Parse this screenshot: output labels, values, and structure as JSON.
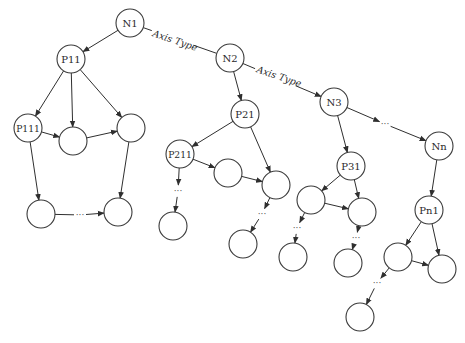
{
  "diagram": {
    "title": "",
    "colors": {
      "stroke": "#3a3a3a",
      "edge": "#2f2f2f",
      "text": "#2a2a2a",
      "background": "#ffffff"
    },
    "node_radius": 14,
    "nodes": [
      {
        "id": "N1",
        "label": "N1",
        "x": 130,
        "y": 23
      },
      {
        "id": "N2",
        "label": "N2",
        "x": 230,
        "y": 58
      },
      {
        "id": "N3",
        "label": "N3",
        "x": 334,
        "y": 102
      },
      {
        "id": "Nn",
        "label": "Nn",
        "x": 439,
        "y": 146
      },
      {
        "id": "P11",
        "label": "P11",
        "x": 71,
        "y": 59
      },
      {
        "id": "P111",
        "label": "P111",
        "x": 28,
        "y": 128
      },
      {
        "id": "a1",
        "label": "",
        "x": 73,
        "y": 141
      },
      {
        "id": "a2",
        "label": "",
        "x": 131,
        "y": 128
      },
      {
        "id": "a3",
        "label": "",
        "x": 41,
        "y": 214
      },
      {
        "id": "a4",
        "label": "",
        "x": 118,
        "y": 212
      },
      {
        "id": "P21",
        "label": "P21",
        "x": 245,
        "y": 114
      },
      {
        "id": "P211",
        "label": "P211",
        "x": 180,
        "y": 154
      },
      {
        "id": "b1",
        "label": "",
        "x": 228,
        "y": 173
      },
      {
        "id": "b2",
        "label": "",
        "x": 276,
        "y": 185
      },
      {
        "id": "b3",
        "label": "",
        "x": 173,
        "y": 226
      },
      {
        "id": "b4",
        "label": "",
        "x": 243,
        "y": 244
      },
      {
        "id": "P31",
        "label": "P31",
        "x": 351,
        "y": 166
      },
      {
        "id": "c1",
        "label": "",
        "x": 311,
        "y": 200
      },
      {
        "id": "c2",
        "label": "",
        "x": 362,
        "y": 212
      },
      {
        "id": "c3",
        "label": "",
        "x": 293,
        "y": 257
      },
      {
        "id": "c4",
        "label": "",
        "x": 348,
        "y": 263
      },
      {
        "id": "Pn1",
        "label": "Pn1",
        "x": 429,
        "y": 210
      },
      {
        "id": "d1",
        "label": "",
        "x": 398,
        "y": 257
      },
      {
        "id": "d2",
        "label": "",
        "x": 442,
        "y": 269
      },
      {
        "id": "d3",
        "label": "",
        "x": 360,
        "y": 317
      }
    ],
    "ellipses": [
      {
        "id": "e_top",
        "text": "···",
        "x": 385,
        "y": 124
      },
      {
        "id": "e_a",
        "text": "···",
        "x": 80,
        "y": 215
      },
      {
        "id": "e_b1",
        "text": "···",
        "x": 178,
        "y": 191
      },
      {
        "id": "e_b2",
        "text": "···",
        "x": 262,
        "y": 214
      },
      {
        "id": "e_c1",
        "text": "···",
        "x": 297,
        "y": 228
      },
      {
        "id": "e_c2",
        "text": "···",
        "x": 356,
        "y": 238
      },
      {
        "id": "e_d",
        "text": "···",
        "x": 377,
        "y": 283
      }
    ],
    "edges": [
      {
        "from": "N1",
        "to": "N2",
        "arrow": false,
        "label": "Axis Type"
      },
      {
        "from": "N2",
        "to": "N3",
        "arrow": true,
        "label": "Axis Type"
      },
      {
        "from": "N3",
        "to": "e_top",
        "arrow": true
      },
      {
        "from": "e_top",
        "to": "Nn",
        "arrow": true
      },
      {
        "from": "N1",
        "to": "P11",
        "arrow": true
      },
      {
        "from": "P11",
        "to": "P111",
        "arrow": true
      },
      {
        "from": "P11",
        "to": "a1",
        "arrow": true
      },
      {
        "from": "P11",
        "to": "a2",
        "arrow": true
      },
      {
        "from": "P111",
        "to": "a1",
        "arrow": true
      },
      {
        "from": "a1",
        "to": "a2",
        "arrow": true
      },
      {
        "from": "P111",
        "to": "a3",
        "arrow": true
      },
      {
        "from": "a2",
        "to": "a4",
        "arrow": true
      },
      {
        "from": "a3",
        "to": "e_a",
        "arrow": false
      },
      {
        "from": "e_a",
        "to": "a4",
        "arrow": true
      },
      {
        "from": "N2",
        "to": "P21",
        "arrow": true
      },
      {
        "from": "P21",
        "to": "P211",
        "arrow": true
      },
      {
        "from": "P21",
        "to": "b2",
        "arrow": true
      },
      {
        "from": "P211",
        "to": "b1",
        "arrow": true
      },
      {
        "from": "b1",
        "to": "b2",
        "arrow": true
      },
      {
        "from": "P211",
        "to": "e_b1",
        "arrow": true
      },
      {
        "from": "e_b1",
        "to": "b3",
        "arrow": true
      },
      {
        "from": "b2",
        "to": "e_b2",
        "arrow": true
      },
      {
        "from": "e_b2",
        "to": "b4",
        "arrow": true
      },
      {
        "from": "N3",
        "to": "P31",
        "arrow": true
      },
      {
        "from": "P31",
        "to": "c1",
        "arrow": true
      },
      {
        "from": "P31",
        "to": "c2",
        "arrow": true
      },
      {
        "from": "c1",
        "to": "c2",
        "arrow": true
      },
      {
        "from": "c1",
        "to": "e_c1",
        "arrow": true
      },
      {
        "from": "e_c1",
        "to": "c3",
        "arrow": true
      },
      {
        "from": "c2",
        "to": "e_c2",
        "arrow": true
      },
      {
        "from": "e_c2",
        "to": "c4",
        "arrow": true
      },
      {
        "from": "Nn",
        "to": "Pn1",
        "arrow": true
      },
      {
        "from": "Pn1",
        "to": "d1",
        "arrow": true
      },
      {
        "from": "Pn1",
        "to": "d2",
        "arrow": true
      },
      {
        "from": "d1",
        "to": "d2",
        "arrow": true
      },
      {
        "from": "d1",
        "to": "e_d",
        "arrow": true
      },
      {
        "from": "e_d",
        "to": "d3",
        "arrow": true
      }
    ],
    "edge_labels": [
      {
        "text": "Axis Type",
        "x": 152,
        "y": 36,
        "angle": 19
      },
      {
        "text": "Axis Type",
        "x": 256,
        "y": 72,
        "angle": 19
      }
    ]
  }
}
